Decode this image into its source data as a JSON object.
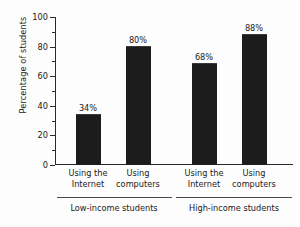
{
  "chart_data": {
    "type": "bar",
    "title": "",
    "subtitle": "",
    "xlabel": "",
    "ylabel": "Percentage of students",
    "ylim": [
      0,
      100
    ],
    "ytick_step": 20,
    "yminor_step": 10,
    "grid": false,
    "legend": null,
    "categories": [
      "Using the Internet",
      "Using computers",
      "Using the Internet",
      "Using computers"
    ],
    "values": [
      34,
      80,
      68,
      88
    ],
    "data_labels": [
      "34%",
      "80%",
      "68%",
      "88%"
    ],
    "groups": [
      {
        "label": "Low-income students",
        "categories": [
          0,
          1
        ]
      },
      {
        "label": "High-income students",
        "categories": [
          2,
          3
        ]
      }
    ],
    "bars": [
      {
        "line1": "Using the",
        "line2": "Internet",
        "value": 34,
        "label": "34%",
        "group": "Low-income students"
      },
      {
        "line1": "Using",
        "line2": "computers",
        "value": 80,
        "label": "80%",
        "group": "Low-income students"
      },
      {
        "line1": "Using the",
        "line2": "Internet",
        "value": 68,
        "label": "68%",
        "group": "High-income students"
      },
      {
        "line1": "Using",
        "line2": "computers",
        "value": 88,
        "label": "88%",
        "group": "High-income students"
      }
    ],
    "ytick_labels": [
      "0",
      "20",
      "40",
      "60",
      "80",
      "100"
    ],
    "ytick_values": [
      0,
      20,
      40,
      60,
      80,
      100
    ],
    "yminor_values": [
      10,
      30,
      50,
      70,
      90
    ],
    "colors": {
      "bar": "#1c1c1c",
      "axis": "#2a2a2a",
      "text": "#1a1a1a",
      "background": "#fdfdfd",
      "rule": "#4a4a4a"
    }
  }
}
